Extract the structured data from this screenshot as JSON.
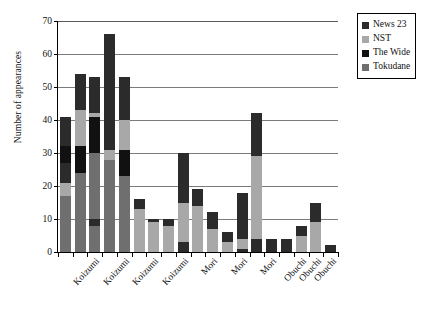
{
  "chart_data": {
    "type": "bar",
    "stacked": true,
    "title": "",
    "xlabel": "",
    "ylabel": "Number of appearances",
    "ylim": [
      0,
      70
    ],
    "yticks": [
      0,
      10,
      20,
      30,
      40,
      50,
      60,
      70
    ],
    "grid": true,
    "legend_position": "top-right",
    "categories": [
      "Koizumi",
      "Koizumi",
      "Koizumi",
      "Koizumi",
      "Mori",
      "Mori",
      "Mori",
      "Obuchi",
      "Obuchi",
      "Obuchi"
    ],
    "series": [
      {
        "name": "News 23",
        "color": "#2b2b2b",
        "values": [
          7,
          11,
          9,
          11,
          3,
          2,
          1,
          4,
          1,
          1
        ]
      },
      {
        "name": "NST",
        "color": "#a8a8a8",
        "values": [
          4,
          0,
          3,
          0,
          0,
          0,
          0,
          0,
          0,
          0
        ]
      },
      {
        "name": "The Wide",
        "color": "#111111",
        "values": [
          4,
          13,
          3,
          13,
          0,
          3,
          4,
          8,
          0,
          0
        ]
      },
      {
        "name": "Tokudane",
        "color": "#6f6f6f",
        "values": [
          17,
          19,
          26,
          16,
          6,
          9,
          8,
          17,
          3,
          7
        ]
      }
    ],
    "totals": [
      41,
      54,
      53,
      66,
      53,
      16,
      10,
      10,
      30,
      19,
      12,
      6,
      18,
      42,
      4,
      4,
      8,
      15,
      2
    ],
    "bar_totals": [
      41,
      54,
      53,
      66,
      53,
      16,
      10,
      10,
      30,
      19,
      12,
      6,
      18,
      42,
      4,
      4,
      8,
      15,
      2
    ],
    "bars": [
      {
        "category": "Koizumi",
        "total": 41,
        "segments": [
          {
            "series": "Tokudane",
            "value": 17
          },
          {
            "series": "NST",
            "value": 4
          },
          {
            "series": "News 23",
            "value": 6
          },
          {
            "series": "The Wide",
            "value": 5
          },
          {
            "series": "News 23",
            "value": 9
          }
        ]
      },
      {
        "category": "Koizumi",
        "total": 54,
        "segments": [
          {
            "series": "Tokudane",
            "value": 24
          },
          {
            "series": "The Wide",
            "value": 8
          },
          {
            "series": "NST",
            "value": 11
          },
          {
            "series": "News 23",
            "value": 11
          }
        ]
      },
      {
        "category": "Koizumi",
        "total": 53,
        "segments": [
          {
            "series": "Tokudane",
            "value": 8
          },
          {
            "series": "News 23",
            "value": 2
          },
          {
            "series": "Tokudane",
            "value": 20
          },
          {
            "series": "The Wide",
            "value": 11
          },
          {
            "series": "NST",
            "value": 1
          },
          {
            "series": "News 23",
            "value": 11
          }
        ]
      },
      {
        "category": "Koizumi",
        "total": 66,
        "segments": [
          {
            "series": "Tokudane",
            "value": 28
          },
          {
            "series": "NST",
            "value": 3
          },
          {
            "series": "News 23",
            "value": 35
          }
        ]
      },
      {
        "category": "Koizumi",
        "total": 53,
        "segments": [
          {
            "series": "Tokudane",
            "value": 23
          },
          {
            "series": "The Wide",
            "value": 8
          },
          {
            "series": "NST",
            "value": 9
          },
          {
            "series": "News 23",
            "value": 13
          }
        ]
      },
      {
        "category": "Koizumi",
        "total": 16,
        "segments": [
          {
            "series": "NST",
            "value": 13
          },
          {
            "series": "News 23",
            "value": 3
          }
        ]
      },
      {
        "category": "Mori",
        "total": 10,
        "segments": [
          {
            "series": "NST",
            "value": 9
          },
          {
            "series": "News 23",
            "value": 1
          }
        ]
      },
      {
        "category": "Mori",
        "total": 10,
        "segments": [
          {
            "series": "NST",
            "value": 8
          },
          {
            "series": "News 23",
            "value": 2
          }
        ]
      },
      {
        "category": "Mori",
        "total": 30,
        "segments": [
          {
            "series": "News 23",
            "value": 3
          },
          {
            "series": "NST",
            "value": 12
          },
          {
            "series": "News 23",
            "value": 15
          }
        ]
      },
      {
        "category": "Mori",
        "total": 19,
        "segments": [
          {
            "series": "NST",
            "value": 14
          },
          {
            "series": "News 23",
            "value": 5
          }
        ]
      },
      {
        "category": "Mori",
        "total": 12,
        "segments": [
          {
            "series": "NST",
            "value": 7
          },
          {
            "series": "News 23",
            "value": 5
          }
        ]
      },
      {
        "category": "Mori",
        "total": 6,
        "segments": [
          {
            "series": "NST",
            "value": 3
          },
          {
            "series": "News 23",
            "value": 3
          }
        ]
      },
      {
        "category": "Obuchi",
        "total": 18,
        "segments": [
          {
            "series": "News 23",
            "value": 1
          },
          {
            "series": "NST",
            "value": 3
          },
          {
            "series": "News 23",
            "value": 14
          }
        ]
      },
      {
        "category": "Obuchi",
        "total": 42,
        "segments": [
          {
            "series": "News 23",
            "value": 4
          },
          {
            "series": "NST",
            "value": 25
          },
          {
            "series": "News 23",
            "value": 13
          }
        ]
      },
      {
        "category": "Obuchi",
        "total": 4,
        "segments": [
          {
            "series": "News 23",
            "value": 4
          }
        ]
      },
      {
        "category": "Obuchi",
        "total": 4,
        "segments": [
          {
            "series": "News 23",
            "value": 4
          }
        ]
      },
      {
        "category": "Obuchi",
        "total": 8,
        "segments": [
          {
            "series": "NST",
            "value": 5
          },
          {
            "series": "News 23",
            "value": 3
          }
        ]
      },
      {
        "category": "Obuchi",
        "total": 15,
        "segments": [
          {
            "series": "NST",
            "value": 9
          },
          {
            "series": "News 23",
            "value": 6
          }
        ]
      },
      {
        "category": "Obuchi",
        "total": 2,
        "segments": [
          {
            "series": "News 23",
            "value": 2
          }
        ]
      }
    ]
  },
  "legend": {
    "items": [
      {
        "label": "News 23",
        "color": "#2b2b2b"
      },
      {
        "label": "NST",
        "color": "#a8a8a8"
      },
      {
        "label": "The Wide",
        "color": "#111111"
      },
      {
        "label": "Tokudane",
        "color": "#6f6f6f"
      }
    ]
  },
  "axis_labels": {
    "x": [
      "Koizumi",
      "Koizumi",
      "Koizumi",
      "Koizumi",
      "Mori",
      "Mori",
      "Mori",
      "Obuchi",
      "Obuchi",
      "Obuchi"
    ],
    "x_positions": [
      2,
      4,
      6,
      8,
      10,
      12,
      14,
      16,
      17,
      18
    ]
  }
}
